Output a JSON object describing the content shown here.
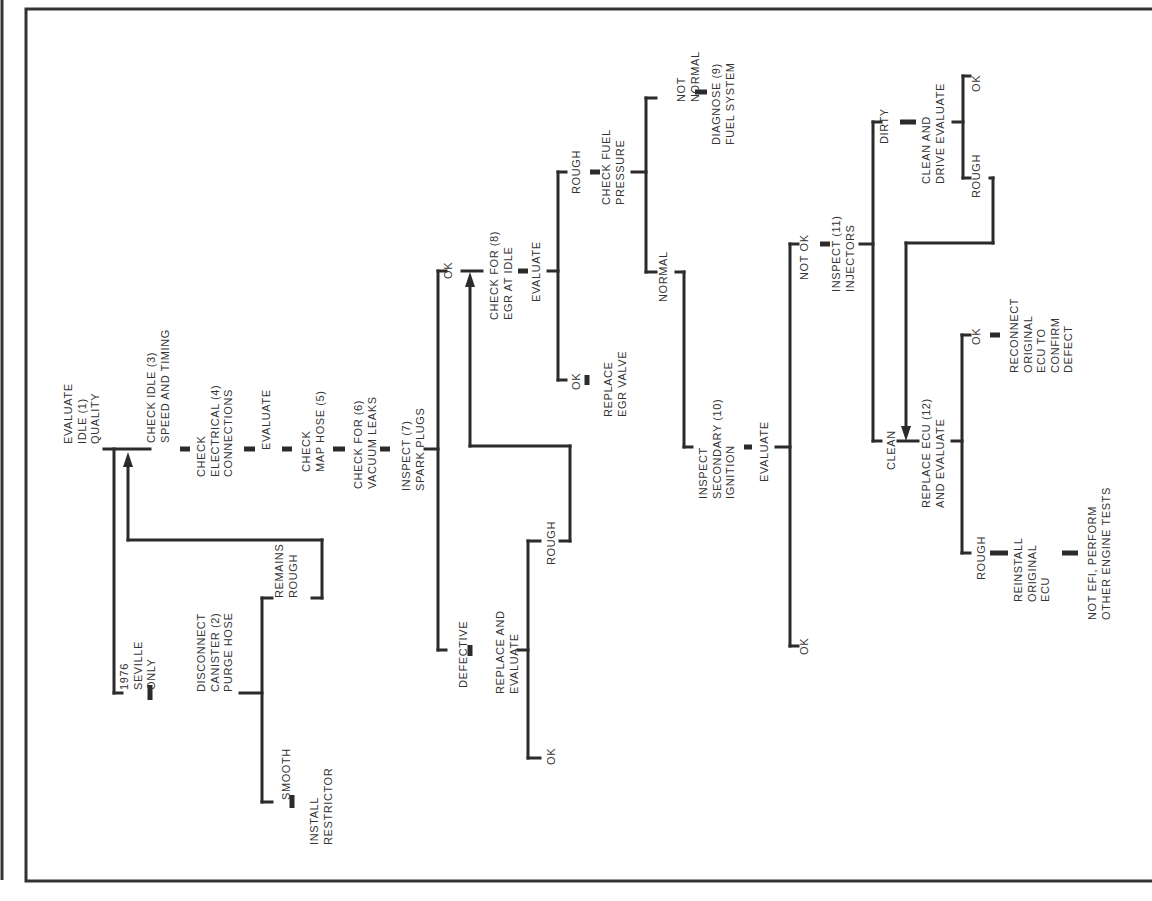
{
  "diagram": {
    "nodes": [
      {
        "id": "n1",
        "lines": [
          "EVALUATE",
          "IDLE (1)",
          "QUALITY"
        ],
        "x": 72,
        "y": 444
      },
      {
        "id": "n_seville",
        "lines": [
          "1976",
          "SEVILLE",
          "ONLY"
        ],
        "x": 128,
        "y": 690
      },
      {
        "id": "n2",
        "lines": [
          "DISCONNECT",
          "CANISTER (2)",
          "PURGE HOSE"
        ],
        "x": 205,
        "y": 692
      },
      {
        "id": "n_remains",
        "lines": [
          "REMAINS",
          "ROUGH"
        ],
        "x": 283,
        "y": 598
      },
      {
        "id": "n_smooth",
        "lines": [
          "SMOOTH"
        ],
        "x": 290,
        "y": 800
      },
      {
        "id": "n_restrictor",
        "lines": [
          "INSTALL",
          "RESTRICTOR"
        ],
        "x": 318,
        "y": 845
      },
      {
        "id": "n3",
        "lines": [
          "CHECK IDLE (3)",
          "SPEED AND TIMING"
        ],
        "x": 155,
        "y": 443
      },
      {
        "id": "n4",
        "lines": [
          "CHECK",
          "ELECTRICAL (4)",
          "CONNECTIONS"
        ],
        "x": 205,
        "y": 477
      },
      {
        "id": "n_eval1",
        "lines": [
          "EVALUATE"
        ],
        "x": 270,
        "y": 450
      },
      {
        "id": "n5",
        "lines": [
          "CHECK",
          "MAP HOSE (5)"
        ],
        "x": 310,
        "y": 472
      },
      {
        "id": "n6",
        "lines": [
          "CHECK FOR (6)",
          "VACUUM LEAKS"
        ],
        "x": 362,
        "y": 489
      },
      {
        "id": "n7",
        "lines": [
          "INSPECT (7)",
          "SPARK PLUGS"
        ],
        "x": 410,
        "y": 491
      },
      {
        "id": "n_ok7",
        "lines": [
          "OK"
        ],
        "x": 452,
        "y": 279
      },
      {
        "id": "n_def",
        "lines": [
          "DEFECTIVE"
        ],
        "x": 467,
        "y": 688
      },
      {
        "id": "n_replace",
        "lines": [
          "REPLACE AND",
          "EVALUATE"
        ],
        "x": 504,
        "y": 694
      },
      {
        "id": "n_rough7",
        "lines": [
          "ROUGH"
        ],
        "x": 555,
        "y": 565
      },
      {
        "id": "n_ok7b",
        "lines": [
          "OK"
        ],
        "x": 555,
        "y": 765
      },
      {
        "id": "n8",
        "lines": [
          "CHECK FOR (8)",
          "EGR AT IDLE"
        ],
        "x": 498,
        "y": 320
      },
      {
        "id": "n_eval8",
        "lines": [
          "EVALUATE"
        ],
        "x": 540,
        "y": 302
      },
      {
        "id": "n_rough8",
        "lines": [
          "ROUGH"
        ],
        "x": 580,
        "y": 194
      },
      {
        "id": "n_ok8",
        "lines": [
          "OK"
        ],
        "x": 580,
        "y": 390
      },
      {
        "id": "n_egr",
        "lines": [
          "REPLACE",
          "EGR VALVE"
        ],
        "x": 612,
        "y": 417
      },
      {
        "id": "n_fuel",
        "lines": [
          "CHECK FUEL",
          "PRESSURE"
        ],
        "x": 610,
        "y": 205
      },
      {
        "id": "n_notnormal",
        "lines": [
          "NOT",
          "NORMAL"
        ],
        "x": 685,
        "y": 102
      },
      {
        "id": "n9",
        "lines": [
          "DIAGNOSE (9)",
          "FUEL SYSTEM"
        ],
        "x": 720,
        "y": 145
      },
      {
        "id": "n_normal",
        "lines": [
          "NORMAL"
        ],
        "x": 667,
        "y": 302
      },
      {
        "id": "n10",
        "lines": [
          "INSPECT",
          "SECONDARY (10)",
          "IGNITION"
        ],
        "x": 707,
        "y": 499
      },
      {
        "id": "n_eval10",
        "lines": [
          "EVALUATE"
        ],
        "x": 768,
        "y": 482
      },
      {
        "id": "n_ok10",
        "lines": [
          "OK"
        ],
        "x": 808,
        "y": 655
      },
      {
        "id": "n_notok",
        "lines": [
          "NOT OK"
        ],
        "x": 808,
        "y": 280
      },
      {
        "id": "n11",
        "lines": [
          "INSPECT (11)",
          "INJECTORS"
        ],
        "x": 840,
        "y": 292
      },
      {
        "id": "n_dirty",
        "lines": [
          "DIRTY"
        ],
        "x": 888,
        "y": 144
      },
      {
        "id": "n_clean_drive",
        "lines": [
          "CLEAN AND",
          "DRIVE EVALUATE"
        ],
        "x": 930,
        "y": 184
      },
      {
        "id": "n_ok_dirty",
        "lines": [
          "OK"
        ],
        "x": 980,
        "y": 92
      },
      {
        "id": "n_rough_dirty",
        "lines": [
          "ROUGH"
        ],
        "x": 980,
        "y": 198
      },
      {
        "id": "n_clean",
        "lines": [
          "CLEAN"
        ],
        "x": 895,
        "y": 470
      },
      {
        "id": "n12",
        "lines": [
          "REPLACE ECU (12)",
          "AND EVALUATE"
        ],
        "x": 930,
        "y": 508
      },
      {
        "id": "n_ok12",
        "lines": [
          "OK"
        ],
        "x": 980,
        "y": 345
      },
      {
        "id": "n_reconnect",
        "lines": [
          "RECONNECT",
          "ORIGINAL",
          "ECU TO",
          "CONFIRM",
          "DEFECT"
        ],
        "x": 1018,
        "y": 373
      },
      {
        "id": "n_rough12",
        "lines": [
          "ROUGH"
        ],
        "x": 985,
        "y": 580
      },
      {
        "id": "n_reinstall",
        "lines": [
          "REINSTALL",
          "ORIGINAL",
          "ECU"
        ],
        "x": 1022,
        "y": 602
      },
      {
        "id": "n_notefi",
        "lines": [
          "NOT EFI, PERFORM",
          "OTHER ENGINE TESTS"
        ],
        "x": 1096,
        "y": 620
      }
    ]
  }
}
